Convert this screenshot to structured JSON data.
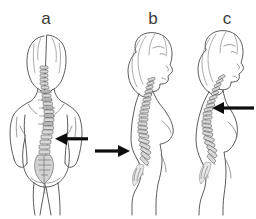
{
  "figure": {
    "kind": "anatomical-line-illustration",
    "background_color": "#ffffff",
    "outline_color": "#4a4a4a",
    "vertebra_fill_color": "#d9d9d9",
    "arrow_color": "#0d0d0d",
    "label_color": "#3b3b3b",
    "width": 256,
    "height": 219
  },
  "panels": [
    {
      "id": "a",
      "label": "a",
      "label_x": 45,
      "label_y": 18,
      "view": "posterior",
      "figure_name": "female-torso-back-view",
      "spine_condition": "lateral-curvature",
      "arrow": {
        "name": "arrow-panel-a",
        "direction": "left",
        "tail_x": 88,
        "tip_x": 55,
        "y": 139,
        "points_to": "lumbar-curve"
      }
    },
    {
      "id": "b",
      "label": "b",
      "label_x": 152,
      "label_y": 18,
      "view": "lateral-left",
      "figure_name": "female-body-side-view",
      "spine_condition": "lumbar-lordosis",
      "arrow": {
        "name": "arrow-panel-b",
        "direction": "right",
        "tail_x": 95,
        "tip_x": 130,
        "y": 151,
        "points_to": "lumbar-region"
      }
    },
    {
      "id": "c",
      "label": "c",
      "label_x": 226,
      "label_y": 18,
      "view": "lateral-left",
      "figure_name": "female-body-side-view",
      "spine_condition": "thoracic-kyphosis",
      "arrow": {
        "name": "arrow-panel-c",
        "direction": "left",
        "tail_x": 254,
        "tip_x": 212,
        "y": 108,
        "points_to": "thoracic-region"
      }
    }
  ]
}
